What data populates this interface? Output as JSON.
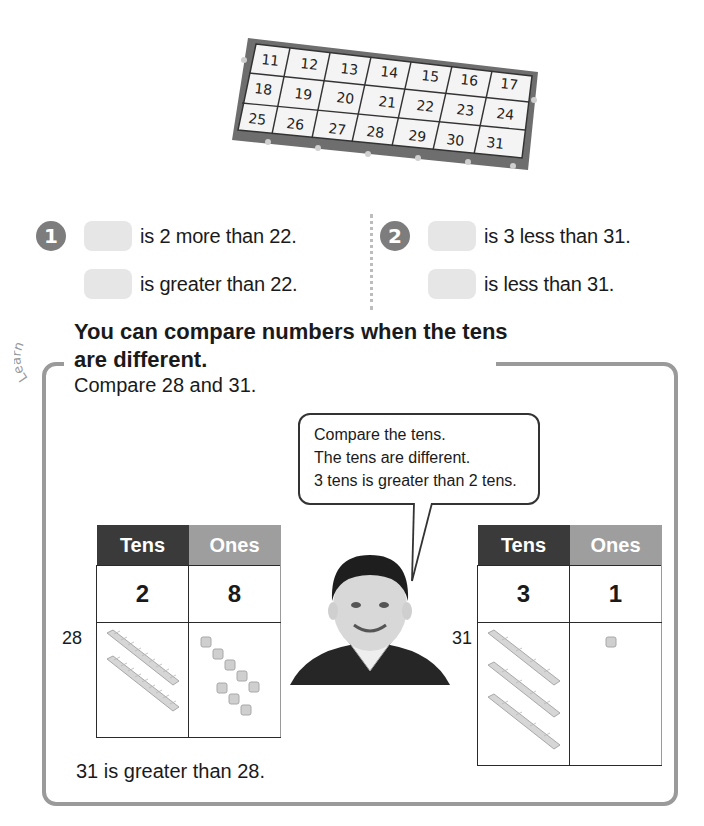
{
  "calendar": {
    "rows": [
      [
        "11",
        "12",
        "13",
        "14",
        "15",
        "16",
        "17"
      ],
      [
        "18",
        "19",
        "20",
        "21",
        "22",
        "23",
        "24"
      ],
      [
        "25",
        "26",
        "27",
        "28",
        "29",
        "30",
        "31"
      ]
    ]
  },
  "exercises": [
    {
      "number": "1",
      "lines": [
        "is 2 more than 22.",
        "is greater than 22."
      ]
    },
    {
      "number": "2",
      "lines": [
        "is 3 less than 31.",
        "is less than 31."
      ]
    }
  ],
  "learn": {
    "tag": "Learn",
    "title_line1": "You can compare numbers when the tens",
    "title_line2": "are different.",
    "prompt": "Compare 28 and 31.",
    "bubble": [
      "Compare the tens.",
      "The tens are different.",
      "3 tens is greater than 2 tens."
    ],
    "tables": [
      {
        "label": "28",
        "headers": {
          "tens": "Tens",
          "ones": "Ones"
        },
        "tens_digit": "2",
        "ones_digit": "8",
        "tens_rods": 2,
        "ones_cubes": 8
      },
      {
        "label": "31",
        "headers": {
          "tens": "Tens",
          "ones": "Ones"
        },
        "tens_digit": "3",
        "ones_digit": "1",
        "tens_rods": 3,
        "ones_cubes": 1
      }
    ],
    "conclusion": "31 is greater than 28."
  },
  "colors": {
    "tens_header": "#3a3a3a",
    "ones_header": "#9e9e9e",
    "frame": "#9a9a9a",
    "blank": "#e6e6e6",
    "badge": "#7d7d7d"
  }
}
